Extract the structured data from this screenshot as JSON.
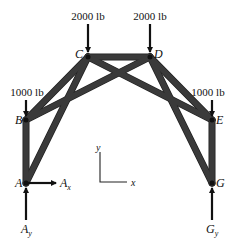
{
  "diagram": {
    "type": "truss-free-body-diagram",
    "joints": {
      "A": {
        "label": "A"
      },
      "B": {
        "label": "B"
      },
      "C": {
        "label": "C"
      },
      "D": {
        "label": "D"
      },
      "E": {
        "label": "E"
      },
      "G": {
        "label": "G"
      }
    },
    "members": [
      "AB",
      "AC",
      "BC",
      "BD",
      "CD",
      "CE",
      "DE",
      "DG",
      "EG"
    ],
    "loads": {
      "C": {
        "label": "2000 lb",
        "direction": "down"
      },
      "D": {
        "label": "2000 lb",
        "direction": "down"
      },
      "B": {
        "label": "1000 lb",
        "direction": "down"
      },
      "E": {
        "label": "1000 lb",
        "direction": "down"
      }
    },
    "reactions": {
      "Ax": {
        "main": "A",
        "sub": "x",
        "direction": "right"
      },
      "Ay": {
        "main": "A",
        "sub": "y",
        "direction": "up"
      },
      "Gy": {
        "main": "G",
        "sub": "y",
        "direction": "up"
      }
    },
    "axes": {
      "x_label": "x",
      "y_label": "y"
    },
    "colors": {
      "member": "#3a3a3a",
      "force": "#111111",
      "background": "#ffffff"
    }
  }
}
